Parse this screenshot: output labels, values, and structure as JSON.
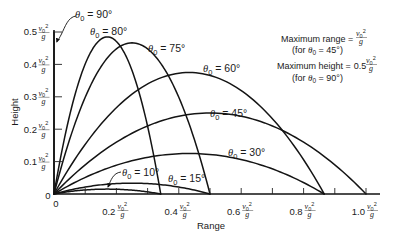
{
  "figure": {
    "unit": {
      "var": "v",
      "sub": "0",
      "sup": "2",
      "den": "g"
    },
    "origin_labels": {
      "x": "0",
      "y": "0"
    },
    "annotations": [
      {
        "label": "Maximum range =",
        "coef": "",
        "note": {
          "prefix": "(for ",
          "symbol": "θ",
          "sub": "0",
          "suffix": " = 45°)"
        }
      },
      {
        "label": "Maximum height =",
        "coef": "0.5",
        "note": {
          "prefix": "(for ",
          "symbol": "θ",
          "sub": "0",
          "suffix": " = 90°)"
        }
      }
    ]
  },
  "chart_data": {
    "type": "line",
    "title": "",
    "xlabel": "Range",
    "ylabel": "Height",
    "units": "v0²/g",
    "xlim": [
      0,
      1.0
    ],
    "ylim": [
      0,
      0.5
    ],
    "grid": false,
    "legend": "inline curve labels",
    "x_ticks": [
      0.1,
      0.2,
      0.3,
      0.4,
      0.5,
      0.6,
      0.7,
      0.8,
      0.9,
      1.0
    ],
    "x_labeled_ticks": [
      {
        "value": 0.2,
        "label": "0.2"
      },
      {
        "value": 0.4,
        "label": "0.4"
      },
      {
        "value": 0.6,
        "label": "0.6"
      },
      {
        "value": 0.8,
        "label": "0.8"
      },
      {
        "value": 1.0,
        "label": "1.0"
      }
    ],
    "y_ticks": [
      0.1,
      0.2,
      0.3,
      0.4,
      0.5
    ],
    "y_labeled_ticks": [
      {
        "value": 0.1,
        "label": "0.1"
      },
      {
        "value": 0.2,
        "label": "0.2"
      },
      {
        "value": 0.3,
        "label": "0.3"
      },
      {
        "value": 0.4,
        "label": "0.4"
      },
      {
        "value": 0.5,
        "label": "0.5"
      }
    ],
    "series": [
      {
        "name": "θ0 = 90°",
        "angle_deg": 90,
        "range": 0,
        "max_height": 0.5,
        "label": {
          "symbol": "θ",
          "sub": "0",
          "text": " = 90°"
        },
        "x": [
          0,
          0
        ],
        "y": [
          0,
          0.5
        ]
      },
      {
        "name": "θ0 = 80°",
        "angle_deg": 80,
        "range": 0.342,
        "max_height": 0.485,
        "label": {
          "symbol": "θ",
          "sub": "0",
          "text": " = 80°"
        },
        "x": [
          0,
          0.05,
          0.1,
          0.15,
          0.171,
          0.2,
          0.25,
          0.3,
          0.342
        ],
        "y": [
          0,
          0.242,
          0.401,
          0.477,
          0.485,
          0.471,
          0.382,
          0.209,
          0
        ]
      },
      {
        "name": "θ0 = 75°",
        "angle_deg": 75,
        "range": 0.5,
        "max_height": 0.467,
        "label": {
          "symbol": "θ",
          "sub": "0",
          "text": " = 75°"
        },
        "x": [
          0,
          0.05,
          0.1,
          0.15,
          0.2,
          0.25,
          0.3,
          0.35,
          0.4,
          0.45,
          0.5
        ],
        "y": [
          0,
          0.168,
          0.299,
          0.392,
          0.448,
          0.467,
          0.448,
          0.392,
          0.299,
          0.168,
          0
        ]
      },
      {
        "name": "θ0 = 60°",
        "angle_deg": 60,
        "range": 0.866,
        "max_height": 0.375,
        "label": {
          "symbol": "θ",
          "sub": "0",
          "text": " = 60°"
        },
        "x": [
          0,
          0.1,
          0.2,
          0.3,
          0.433,
          0.5,
          0.6,
          0.7,
          0.8,
          0.866
        ],
        "y": [
          0,
          0.153,
          0.266,
          0.34,
          0.375,
          0.366,
          0.319,
          0.232,
          0.106,
          0
        ]
      },
      {
        "name": "θ0 = 45°",
        "angle_deg": 45,
        "range": 1.0,
        "max_height": 0.25,
        "label": {
          "symbol": "θ",
          "sub": "0",
          "text": " = 45°"
        },
        "x": [
          0,
          0.1,
          0.2,
          0.3,
          0.4,
          0.5,
          0.6,
          0.7,
          0.8,
          0.9,
          1.0
        ],
        "y": [
          0,
          0.09,
          0.16,
          0.21,
          0.24,
          0.25,
          0.24,
          0.21,
          0.16,
          0.09,
          0
        ]
      },
      {
        "name": "θ0 = 30°",
        "angle_deg": 30,
        "range": 0.866,
        "max_height": 0.125,
        "label": {
          "symbol": "θ",
          "sub": "0",
          "text": " = 30°"
        },
        "x": [
          0,
          0.1,
          0.2,
          0.3,
          0.433,
          0.5,
          0.6,
          0.7,
          0.8,
          0.866
        ],
        "y": [
          0,
          0.051,
          0.089,
          0.113,
          0.125,
          0.122,
          0.106,
          0.078,
          0.035,
          0
        ]
      },
      {
        "name": "θ0 = 15°",
        "angle_deg": 15,
        "range": 0.5,
        "max_height": 0.0335,
        "label": {
          "symbol": "θ",
          "sub": "0",
          "text": " = 15°"
        },
        "x": [
          0,
          0.1,
          0.2,
          0.25,
          0.3,
          0.4,
          0.5
        ],
        "y": [
          0,
          0.021,
          0.032,
          0.0335,
          0.032,
          0.021,
          0
        ]
      },
      {
        "name": "θ0 = 10°",
        "angle_deg": 10,
        "range": 0.342,
        "max_height": 0.0151,
        "label": {
          "symbol": "θ",
          "sub": "0",
          "text": " = 10°"
        },
        "x": [
          0,
          0.1,
          0.171,
          0.25,
          0.342
        ],
        "y": [
          0,
          0.0125,
          0.0151,
          0.0119,
          0
        ]
      }
    ],
    "annotations": [
      "Maximum range = v0²/g (for θ0 = 45°)",
      "Maximum height = 0.5 v0²/g (for θ0 = 90°)"
    ]
  }
}
